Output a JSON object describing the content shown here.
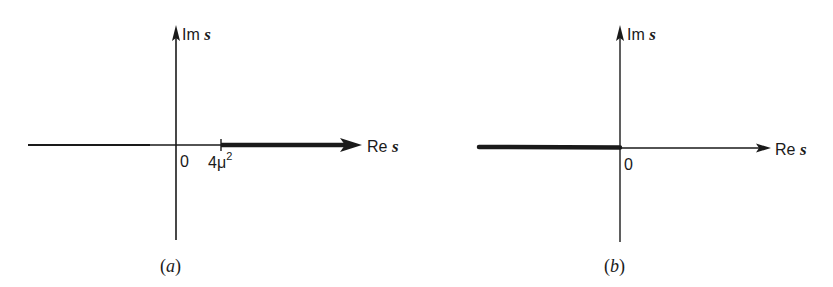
{
  "figure": {
    "panels": [
      {
        "id": "a",
        "caption_open": "(",
        "caption_letter": "a",
        "caption_close": ")",
        "vertical_axis_label_prefix": "Im ",
        "vertical_axis_label_var": "s",
        "horizontal_axis_label_prefix": "Re ",
        "horizontal_axis_label_var": "s",
        "origin_label": "0",
        "branch_point_label_base": "4μ",
        "branch_point_label_exp": "2",
        "cut": "heavy line along real axis from 4μ² to +∞"
      },
      {
        "id": "b",
        "caption_open": "(",
        "caption_letter": "b",
        "caption_close": ")",
        "vertical_axis_label_prefix": "Im ",
        "vertical_axis_label_var": "s",
        "horizontal_axis_label_prefix": "Re ",
        "horizontal_axis_label_var": "s",
        "origin_label": "0",
        "cut": "heavy line along negative real axis from -∞ to 0"
      }
    ],
    "colors": {
      "ink": "#1a1a1a",
      "background": "#ffffff"
    }
  }
}
